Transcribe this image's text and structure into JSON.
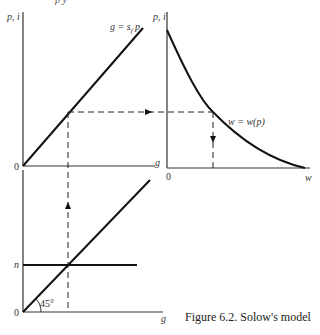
{
  "figure": {
    "caption": "Figure 6.2. Solow's model",
    "top_cut_text": "p        y",
    "upper_left_panel": {
      "y_axis_label": "p, i",
      "x_axis_label": "g",
      "origin_label": "0",
      "line_label": "g = s_f p",
      "line_label_display": "g = s",
      "line_label_sub": "f",
      "line_label_tail": " p"
    },
    "upper_right_panel": {
      "y_axis_label": "p, i",
      "x_axis_label": "w",
      "origin_label": "0",
      "curve_label": "w = w(p)"
    },
    "lower_panel": {
      "y_axis_label_n": "n",
      "x_axis_label": "g",
      "origin_label": "0",
      "angle_label": "45°"
    }
  },
  "colors": {
    "line": "#111111",
    "axis": "#333333",
    "dashed": "#222222",
    "background": "#ffffff"
  }
}
